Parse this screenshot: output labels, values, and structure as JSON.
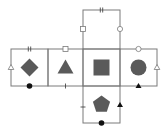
{
  "diagram": {
    "colors": {
      "line": "#7a7a7a",
      "shape_fill": "#5a5a5a",
      "marker_dark": "#111111",
      "background": "#ffffff"
    },
    "faces": [
      {
        "id": "top",
        "shape": "none"
      },
      {
        "id": "left",
        "shape": "diamond"
      },
      {
        "id": "center-left",
        "shape": "triangle"
      },
      {
        "id": "center",
        "shape": "square"
      },
      {
        "id": "right",
        "shape": "circle"
      },
      {
        "id": "bottom",
        "shape": "pentagon"
      }
    ],
    "edge_markers": [
      {
        "edge": "top-face-top",
        "marker": "double-tick"
      },
      {
        "edge": "top-face-left",
        "marker": "hollow-square"
      },
      {
        "edge": "top-face-right",
        "marker": "hollow-circle"
      },
      {
        "edge": "left-face-top",
        "marker": "double-tick"
      },
      {
        "edge": "left-face-left",
        "marker": "hollow-triangle"
      },
      {
        "edge": "left-face-bottom",
        "marker": "filled-circle"
      },
      {
        "edge": "center-left-face-top",
        "marker": "hollow-square"
      },
      {
        "edge": "center-left-face-bottom",
        "marker": "single-tick"
      },
      {
        "edge": "right-face-top",
        "marker": "hollow-circle"
      },
      {
        "edge": "right-face-right",
        "marker": "hollow-triangle"
      },
      {
        "edge": "right-face-bottom",
        "marker": "filled-triangle"
      },
      {
        "edge": "bottom-face-left",
        "marker": "single-tick"
      },
      {
        "edge": "bottom-face-right",
        "marker": "filled-triangle"
      },
      {
        "edge": "bottom-face-bottom",
        "marker": "filled-circle"
      }
    ]
  }
}
